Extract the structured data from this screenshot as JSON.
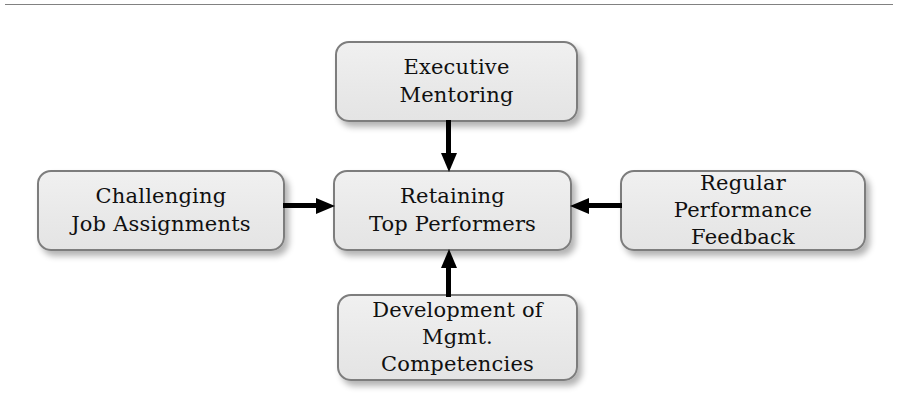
{
  "diagram": {
    "title": "Retaining Top Performers",
    "type": "hub-and-spoke",
    "rule_color": "#6b6b6b",
    "box_fill_color": "#ebebeb",
    "box_border_color": "#7d7d7d",
    "arrow_color": "#000000",
    "background_color": "#ffffff",
    "nodes": {
      "top": {
        "id": "executive-mentoring",
        "line1": "Executive",
        "line2": "Mentoring",
        "text": "Executive\nMentoring"
      },
      "left": {
        "id": "challenging-job-assignments",
        "line1": "Challenging",
        "line2": "Job Assignments",
        "text": "Challenging\nJob Assignments"
      },
      "center": {
        "id": "retaining-top-performers",
        "line1": "Retaining",
        "line2": "Top Performers",
        "text": "Retaining\nTop Performers"
      },
      "right": {
        "id": "regular-performance-feedback",
        "line1": "Regular Performance",
        "line2": "Feedback",
        "text": "Regular Performance\nFeedback"
      },
      "bottom": {
        "id": "development-of-mgmt-competencies",
        "line1": "Development of",
        "line2": "Mgmt. Competencies",
        "text": "Development of\nMgmt. Competencies"
      }
    },
    "arrows": [
      {
        "id": "arrow-executive-mentoring-to-center",
        "from": "top",
        "to": "center",
        "direction": "down"
      },
      {
        "id": "arrow-challenging-job-assignments-to-center",
        "from": "left",
        "to": "center",
        "direction": "right"
      },
      {
        "id": "arrow-regular-performance-feedback-to-center",
        "from": "right",
        "to": "center",
        "direction": "left"
      },
      {
        "id": "arrow-development-competencies-to-center",
        "from": "bottom",
        "to": "center",
        "direction": "up"
      }
    ]
  }
}
